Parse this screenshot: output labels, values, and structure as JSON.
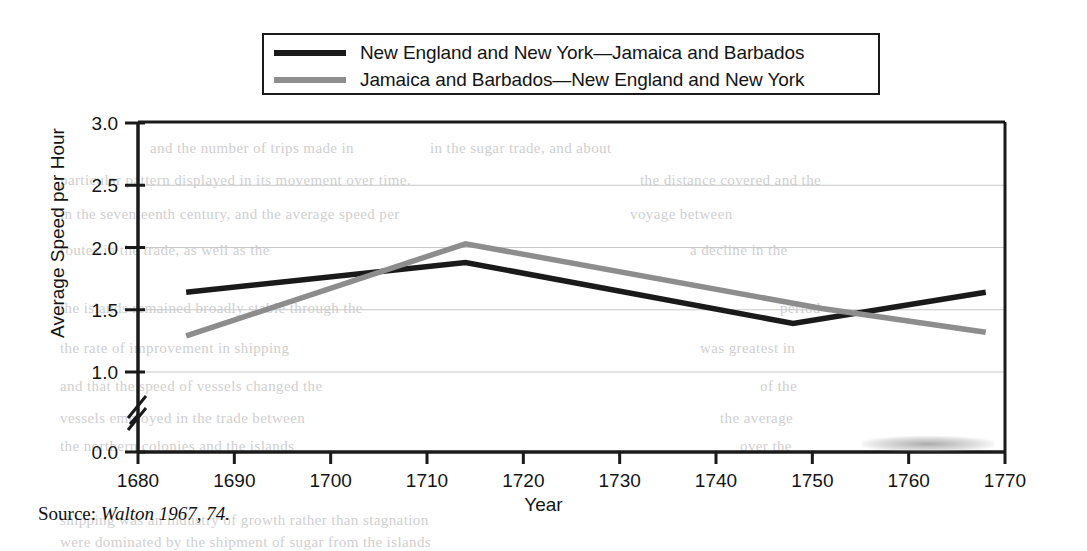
{
  "figure": {
    "source_note_prefix": "Source:",
    "source_note_citation": "Walton 1967, 74."
  },
  "legend": {
    "position": "top-center",
    "entries": [
      {
        "label": "New England and New York—Jamaica and Barbados",
        "color": "#1a1a1a",
        "swatch": "line-swatch-dark"
      },
      {
        "label": "Jamaica and Barbados—New England and New York",
        "color": "#8d8d8d",
        "swatch": "line-swatch-gray"
      }
    ]
  },
  "chart_data": {
    "type": "line",
    "title": "",
    "xlabel": "Year",
    "ylabel": "Average Speed per Hour",
    "xlim": [
      1680,
      1770
    ],
    "ylim": [
      0.0,
      3.0
    ],
    "yaxis_break": true,
    "yaxis_break_between": [
      0.0,
      1.0
    ],
    "grid": true,
    "xticks": [
      1680,
      1690,
      1700,
      1710,
      1720,
      1730,
      1740,
      1750,
      1760,
      1770
    ],
    "xticklabels": [
      "1680",
      "1690",
      "1700",
      "1710",
      "1720",
      "1730",
      "1740",
      "1750",
      "1760",
      "1770"
    ],
    "yticks": [
      0.0,
      1.0,
      1.5,
      2.0,
      2.5,
      3.0
    ],
    "yticklabels": [
      "0.0",
      "1.0",
      "1.5",
      "2.0",
      "2.5",
      "3.0"
    ],
    "series": [
      {
        "name": "New England and New York—Jamaica and Barbados",
        "color": "#1a1a1a",
        "x": [
          1685,
          1714,
          1748,
          1768
        ],
        "values": [
          1.64,
          1.88,
          1.39,
          1.64
        ]
      },
      {
        "name": "Jamaica and Barbados—New England and New York",
        "color": "#8d8d8d",
        "x": [
          1685,
          1714,
          1751,
          1768
        ],
        "values": [
          1.29,
          2.03,
          1.51,
          1.32
        ]
      }
    ]
  },
  "bleed_text": {
    "lines": [
      {
        "text": "and the number of trips made in",
        "x": 150,
        "y": 140
      },
      {
        "text": "in the sugar trade, and about",
        "x": 430,
        "y": 140
      },
      {
        "text": "particular pattern displayed in its movement over time.",
        "x": 60,
        "y": 172
      },
      {
        "text": "the distance covered and the",
        "x": 640,
        "y": 172
      },
      {
        "text": "in the seventeenth century, and the average speed per",
        "x": 60,
        "y": 206
      },
      {
        "text": "voyage between",
        "x": 630,
        "y": 206
      },
      {
        "text": "routes in the trade, as well as the",
        "x": 60,
        "y": 242
      },
      {
        "text": "a decline in the",
        "x": 690,
        "y": 242
      },
      {
        "text": "the islands remained broadly stable through the",
        "x": 60,
        "y": 300
      },
      {
        "text": "period",
        "x": 780,
        "y": 300
      },
      {
        "text": "the rate of improvement in shipping",
        "x": 60,
        "y": 340
      },
      {
        "text": "was greatest in",
        "x": 700,
        "y": 340
      },
      {
        "text": "and that the speed of vessels changed the",
        "x": 60,
        "y": 378
      },
      {
        "text": "of the",
        "x": 760,
        "y": 378
      },
      {
        "text": "vessels employed in the trade between",
        "x": 60,
        "y": 410
      },
      {
        "text": "the average",
        "x": 720,
        "y": 410
      },
      {
        "text": "the northern colonies and the islands",
        "x": 60,
        "y": 438
      },
      {
        "text": "over the",
        "x": 740,
        "y": 438
      },
      {
        "text": "shipping was an industry of growth rather than stagnation",
        "x": 60,
        "y": 512
      },
      {
        "text": "were dominated by the shipment of sugar from the islands",
        "x": 60,
        "y": 534
      }
    ]
  }
}
